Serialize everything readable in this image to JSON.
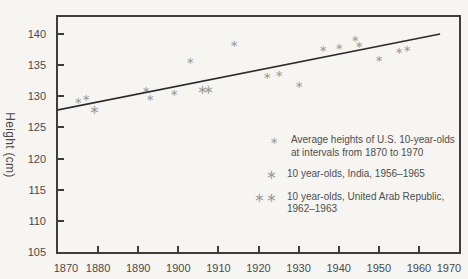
{
  "figure": {
    "background": "#f6f5f1",
    "axis_color": "#3d3d3d",
    "text_color": "#4a4a4a",
    "marker_color": "#9c9c9c",
    "trend_color": "#2c2c2c"
  },
  "chart_data": {
    "type": "scatter",
    "title": "",
    "xlabel": "",
    "ylabel": "Height (cm)",
    "xlim": [
      1870,
      1970
    ],
    "ylim": [
      105,
      142.7
    ],
    "grid": false,
    "x_ticks": [
      1870,
      1880,
      1890,
      1900,
      1910,
      1920,
      1930,
      1940,
      1950,
      1960,
      1970
    ],
    "y_ticks": [
      105,
      110,
      115,
      120,
      125,
      130,
      135,
      140
    ],
    "series": [
      {
        "name": "Average heights of U.S. 10-year-olds at intervals from 1870 to 1970",
        "marker": "asterisk-small",
        "points": [
          [
            1875,
            129.3
          ],
          [
            1877,
            129.7
          ],
          [
            1892,
            131.0
          ],
          [
            1893,
            129.7
          ],
          [
            1899,
            130.5
          ],
          [
            1903,
            135.7
          ],
          [
            1914,
            138.4
          ],
          [
            1922,
            133.3
          ],
          [
            1925,
            133.6
          ],
          [
            1930,
            131.8
          ],
          [
            1936,
            137.6
          ],
          [
            1940,
            137.9
          ],
          [
            1944,
            139.2
          ],
          [
            1945,
            138.2
          ],
          [
            1950,
            136.0
          ],
          [
            1955,
            137.2
          ],
          [
            1957,
            137.6
          ]
        ]
      },
      {
        "name": "10 year-olds, India, 1956–1965",
        "marker": "asterisk-large",
        "points": [
          [
            1879,
            128.0
          ]
        ]
      },
      {
        "name": "10 year-olds, United Arab Republic, 1962–1963",
        "marker": "asterisk-large",
        "points": [
          [
            1906,
            131.1
          ],
          [
            1907.5,
            131.1
          ]
        ]
      }
    ],
    "trend_line": {
      "x": [
        1870,
        1965.3
      ],
      "y": [
        127.8,
        140.0
      ]
    },
    "legend": {
      "position": "inside-lower-right",
      "items": [
        {
          "marker": "∗",
          "lines": [
            "Average heights of U.S. 10-year-olds",
            "at intervals from 1870 to 1970"
          ]
        },
        {
          "marker": "∗",
          "lines": [
            "10 year-olds, India, 1956–1965"
          ]
        },
        {
          "marker": "∗∗",
          "lines": [
            "10 year-olds, United Arab Republic,",
            "1962–1963"
          ]
        }
      ]
    }
  }
}
